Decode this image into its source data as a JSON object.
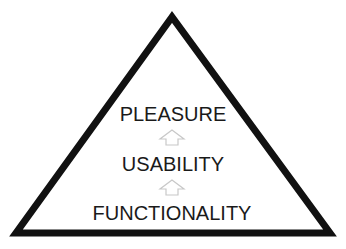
{
  "diagram": {
    "type": "hierarchy-pyramid",
    "levels": [
      {
        "label": "PLEASURE"
      },
      {
        "label": "USABILITY"
      },
      {
        "label": "FUNCTIONALITY"
      }
    ],
    "arrows": [
      {
        "from": "USABILITY",
        "to": "PLEASURE",
        "icon": "up-arrow-outline-icon"
      },
      {
        "from": "FUNCTIONALITY",
        "to": "USABILITY",
        "icon": "up-arrow-outline-icon"
      }
    ],
    "colors": {
      "stroke": "#111111",
      "text": "#1a1a1a",
      "arrow": "#c8c8c8",
      "background": "#ffffff"
    }
  }
}
